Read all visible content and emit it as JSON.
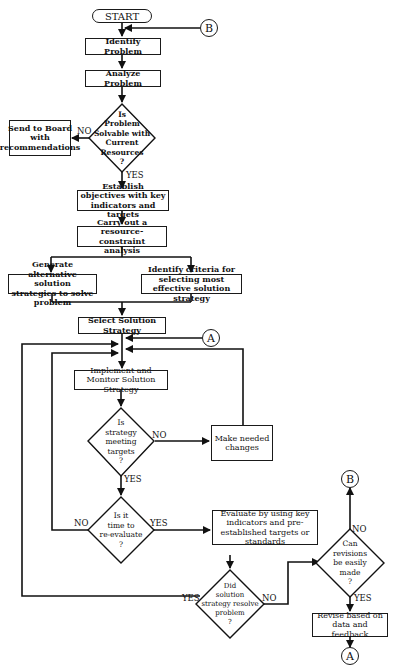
{
  "flowchart": {
    "start": "START",
    "connectors": {
      "a": "A",
      "b": "B"
    },
    "steps": {
      "identify": "Identify Problem",
      "analyze": "Analyze Problem",
      "send_board": "Send to Board with recommendations",
      "establish": "Establish objectives with key indicators and targets",
      "resource": "Carry out a resource-constraint analysis",
      "generate": "Generate alternative solution strategies to solve problem",
      "criteria": "Identify criteria for selecting most effective solution strategy",
      "select": "Select Solution Strategy",
      "implement": "Implement and Monitor Solution Strategy",
      "make_changes": "Make needed changes",
      "evaluate": "Evaluate by using key indicators and pre-established targets or standards",
      "revise": "Revise based on data and feedback"
    },
    "decisions": {
      "solvable": [
        "Is",
        "Problem",
        "Solvable with",
        "Current",
        "Resources",
        "?"
      ],
      "meeting": [
        "Is",
        "strategy",
        "meeting",
        "targets",
        "?"
      ],
      "reevaluate": [
        "Is it",
        "time to",
        "re-evaluate",
        "?"
      ],
      "resolve": [
        "Did",
        "solution",
        "strategy resolve",
        "problem",
        "?"
      ],
      "revisions": [
        "Can",
        "revisions",
        "be easily",
        "made",
        "?"
      ]
    },
    "labels": {
      "yes": "YES",
      "no": "NO"
    }
  }
}
